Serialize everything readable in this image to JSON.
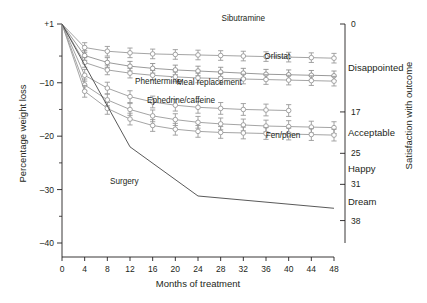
{
  "chart_data": {
    "type": "line",
    "title": "",
    "xlabel": "Months of treatment",
    "ylabel": "Percentage weight loss",
    "y2label": "Satisfaction with outcome",
    "xlim": [
      0,
      48
    ],
    "ylim": [
      -40,
      1
    ],
    "grid": false,
    "legend_position": "inline-labels",
    "xticks": [
      0,
      4,
      8,
      12,
      16,
      20,
      24,
      28,
      32,
      36,
      40,
      44,
      48
    ],
    "xticklabels": [
      "0",
      "4",
      "8",
      "12",
      "16",
      "20",
      "24",
      "28",
      "32",
      "36",
      "40",
      "44",
      "48"
    ],
    "yticks": [
      1,
      -10,
      -20,
      -30,
      -40
    ],
    "yticklabels": [
      "+1",
      "–10",
      "–20",
      "–30",
      "–40"
    ],
    "yminorticks": [
      -5,
      -15,
      -25,
      -35
    ],
    "y2ticks": [
      0,
      17,
      25,
      31,
      38
    ],
    "y2ticklabels": [
      "0",
      "17",
      "25",
      "31",
      "38"
    ],
    "y2categories": [
      {
        "label": "Disappointed",
        "at": 8.5
      },
      {
        "label": "Acceptable",
        "at": 21
      },
      {
        "label": "Happy",
        "at": 28
      },
      {
        "label": "Dream",
        "at": 34.5
      }
    ],
    "errorbars": true,
    "marker": "circle",
    "series": [
      {
        "name": "Sibutramine",
        "color": "#9a9a9a",
        "label_x": 32,
        "label_y": 1.6,
        "x": [
          0,
          4,
          8,
          12,
          16,
          20,
          24,
          28,
          32,
          36,
          40,
          44,
          48
        ],
        "y": [
          1,
          -3.4,
          -4.1,
          -4.4,
          -4.6,
          -4.7,
          -4.8,
          -4.9,
          -5.0,
          -5.1,
          -5.2,
          -5.3,
          -5.4
        ],
        "err": [
          0,
          0.9,
          0.9,
          0.9,
          0.9,
          0.9,
          0.9,
          0.9,
          0.9,
          0.9,
          0.9,
          0.9,
          0.9
        ]
      },
      {
        "name": "Orlistat",
        "color": "#8f8f8f",
        "label_x": 38,
        "label_y": -5.6,
        "x": [
          0,
          4,
          8,
          12,
          16,
          20,
          24,
          28,
          32,
          36,
          40,
          44,
          48
        ],
        "y": [
          1,
          -4.9,
          -6.2,
          -6.9,
          -7.3,
          -7.6,
          -7.8,
          -8.0,
          -8.2,
          -8.4,
          -8.5,
          -8.6,
          -8.7
        ],
        "err": [
          0,
          0.9,
          0.9,
          0.9,
          0.9,
          0.9,
          0.9,
          0.9,
          0.9,
          0.9,
          0.9,
          0.9,
          0.9
        ]
      },
      {
        "name": "Meal replacement",
        "color": "#9a9a9a",
        "label_x": 26,
        "label_y": -10.4,
        "x": [
          0,
          4,
          8,
          12,
          16,
          20,
          24,
          28,
          32,
          36,
          40,
          44,
          48
        ],
        "y": [
          1,
          -6.2,
          -7.6,
          -8.2,
          -8.6,
          -8.9,
          -9.1,
          -9.2,
          -9.3,
          -9.4,
          -9.5,
          -9.6,
          -9.7
        ],
        "err": [
          0,
          0.9,
          0.9,
          0.9,
          0.9,
          0.9,
          0.9,
          0.9,
          0.9,
          0.9,
          0.9,
          0.9,
          0.9
        ]
      },
      {
        "name": "Phentermine",
        "color": "#9a9a9a",
        "label_x": 17,
        "label_y": -10.2,
        "x": [
          0,
          4,
          8,
          12,
          16,
          20,
          24,
          28,
          32,
          36,
          40
        ],
        "y": [
          1,
          -8.6,
          -11.0,
          -12.6,
          -13.6,
          -14.2,
          -14.6,
          -14.8,
          -15.0,
          -15.1,
          -15.2
        ],
        "err": [
          0,
          1.1,
          1.1,
          1.1,
          1.1,
          1.1,
          1.1,
          1.1,
          1.1,
          1.1,
          1.1
        ]
      },
      {
        "name": "Ephedrine/caffeine",
        "color": "#9a9a9a",
        "label_x": 21,
        "label_y": -13.8,
        "x": [
          0,
          4,
          8,
          12,
          16,
          20,
          24,
          28,
          32,
          36,
          40,
          44,
          48
        ],
        "y": [
          1,
          -10.4,
          -13.2,
          -15.0,
          -16.2,
          -16.9,
          -17.4,
          -17.7,
          -17.9,
          -18.1,
          -18.2,
          -18.3,
          -18.4
        ],
        "err": [
          0,
          1.1,
          1.1,
          1.1,
          1.1,
          1.1,
          1.1,
          1.1,
          1.1,
          1.1,
          1.1,
          1.1,
          1.1
        ]
      },
      {
        "name": "Fen/phen",
        "color": "#9a9a9a",
        "label_x": 39,
        "label_y": -20.4,
        "x": [
          0,
          4,
          8,
          12,
          16,
          20,
          24,
          28,
          32,
          36,
          40,
          44,
          48
        ],
        "y": [
          1,
          -11.6,
          -14.8,
          -16.8,
          -18.0,
          -18.7,
          -19.1,
          -19.3,
          -19.4,
          -19.5,
          -19.6,
          -19.7,
          -19.8
        ],
        "err": [
          0,
          1.1,
          1.1,
          1.1,
          1.1,
          1.1,
          1.1,
          1.1,
          1.1,
          1.1,
          1.1,
          1.1,
          1.1
        ]
      },
      {
        "name": "Surgery",
        "color": "#3b3b3b",
        "marker": "none",
        "errorbars": false,
        "label_x": 11,
        "label_y": -29.0,
        "x": [
          0,
          12,
          24,
          48
        ],
        "y": [
          1,
          -22.0,
          -31.2,
          -33.5
        ],
        "err": [
          0,
          0,
          0,
          0
        ]
      }
    ]
  }
}
